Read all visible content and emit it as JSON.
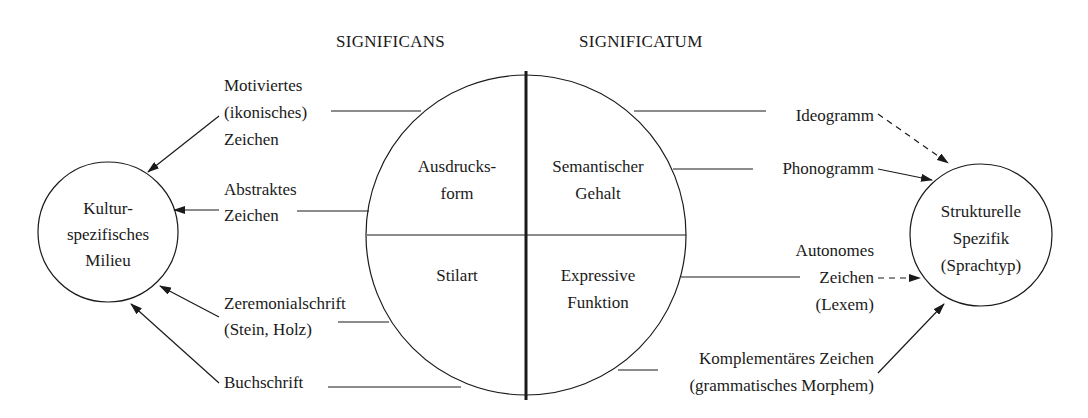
{
  "headers": {
    "significans": "SIGNIFICANS",
    "significatum": "SIGNIFICATUM"
  },
  "center_circle": {
    "top_left": [
      "Ausdrucks-",
      "form"
    ],
    "top_right": [
      "Semantischer",
      "Gehalt"
    ],
    "bottom_left": [
      "Stilart"
    ],
    "bottom_right": [
      "Expressive",
      "Funktion"
    ]
  },
  "left_circle": {
    "lines": [
      "Kultur-",
      "spezifisches",
      "Milieu"
    ]
  },
  "right_circle": {
    "lines": [
      "Strukturelle",
      "Spezifik",
      "(Sprachtyp)"
    ]
  },
  "left_labels": {
    "motiviertes": [
      "Motiviertes",
      "(ikonisches)",
      "Zeichen"
    ],
    "abstraktes": [
      "Abstraktes",
      "Zeichen"
    ],
    "zeremonial": [
      "Zeremonialschrift",
      "(Stein, Holz)"
    ],
    "buchschrift": [
      "Buchschrift"
    ]
  },
  "right_labels": {
    "ideogramm": [
      "Ideogramm"
    ],
    "phonogramm": [
      "Phonogramm"
    ],
    "autonomes": [
      "Autonomes",
      "Zeichen",
      "(Lexem)"
    ],
    "komplementaer": [
      "Komplementäres Zeichen",
      "(grammatisches Morphem)"
    ]
  },
  "edges": [
    {
      "from": "Motiviertes (ikonisches) Zeichen",
      "to": "Kulturspezifisches Milieu",
      "style": "solid"
    },
    {
      "from": "Abstraktes Zeichen",
      "to": "Kulturspezifisches Milieu",
      "style": "solid"
    },
    {
      "from": "Zeremonialschrift (Stein, Holz)",
      "to": "Kulturspezifisches Milieu",
      "style": "solid"
    },
    {
      "from": "Buchschrift",
      "to": "Kulturspezifisches Milieu",
      "style": "solid"
    },
    {
      "from": "Ideogramm",
      "to": "Strukturelle Spezifik (Sprachtyp)",
      "style": "dashed"
    },
    {
      "from": "Phonogramm",
      "to": "Strukturelle Spezifik (Sprachtyp)",
      "style": "solid"
    },
    {
      "from": "Autonomes Zeichen (Lexem)",
      "to": "Strukturelle Spezifik (Sprachtyp)",
      "style": "dashed"
    },
    {
      "from": "Komplementäres Zeichen (grammatisches Morphem)",
      "to": "Strukturelle Spezifik (Sprachtyp)",
      "style": "solid"
    }
  ]
}
